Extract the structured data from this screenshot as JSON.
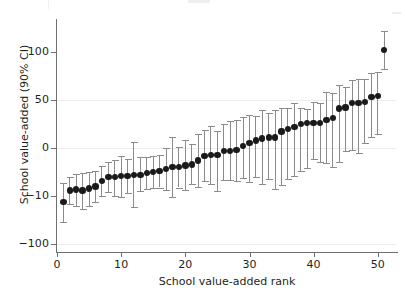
{
  "chart_data": {
    "type": "scatter",
    "subtype": "caterpillar-plot-with-error-bars",
    "title": "",
    "xlabel": "School value-added rank",
    "ylabel": "School value-added (90% CI)",
    "xlim": [
      0,
      53
    ],
    "ylim": [
      -108,
      133
    ],
    "xticks": [
      0,
      10,
      20,
      30,
      40,
      50
    ],
    "xtick_labels": [
      "0",
      "10",
      "20",
      "30",
      "40",
      "50"
    ],
    "yticks": [
      100,
      50,
      0,
      -50,
      -100
    ],
    "ytick_labels": [
      "100",
      "50",
      "0",
      "−10",
      "−100"
    ],
    "grid": "horizontal-only",
    "gridlines_at": [
      50,
      0,
      -100
    ],
    "legend": "none",
    "error_bar_level": "90% CI",
    "marker_color": "#1a1a1a",
    "errorbar_color": "#8b8b8e",
    "gridline_color": "#ededee",
    "axis_color": "#6f6f72",
    "n_points": 52,
    "x": [
      1,
      2,
      3,
      4,
      5,
      6,
      7,
      8,
      9,
      10,
      11,
      12,
      13,
      14,
      15,
      16,
      17,
      18,
      19,
      20,
      21,
      22,
      23,
      24,
      25,
      26,
      27,
      28,
      29,
      30,
      31,
      32,
      33,
      34,
      35,
      36,
      37,
      38,
      39,
      40,
      41,
      42,
      43,
      44,
      45,
      46,
      47,
      48,
      49,
      50,
      51,
      52
    ],
    "y": [
      -56,
      -44,
      -43,
      -44,
      -42,
      -40,
      -34,
      -30,
      -30,
      -29,
      -29,
      -28,
      -28,
      -26,
      -25,
      -24,
      -22,
      -20,
      -20,
      -18,
      -17,
      -13,
      -8,
      -7,
      -7,
      -3,
      -3,
      -2,
      2,
      5,
      8,
      10,
      11,
      11,
      17,
      20,
      22,
      25,
      26,
      26,
      26,
      29,
      31,
      41,
      42,
      47,
      47,
      48,
      53,
      54,
      102
    ],
    "y_lower": [
      -77,
      -58,
      -60,
      -63,
      -60,
      -56,
      -50,
      -46,
      -50,
      -51,
      -47,
      -61,
      -45,
      -43,
      -42,
      -41,
      -44,
      -51,
      -41,
      -44,
      -37,
      -40,
      -34,
      -37,
      -45,
      -33,
      -33,
      -34,
      -31,
      -35,
      -30,
      -37,
      -32,
      -43,
      -38,
      -32,
      -29,
      -24,
      -21,
      -11,
      -14,
      -16,
      -20,
      -14,
      -3,
      -2,
      -5,
      5,
      11,
      15,
      82
    ],
    "y_upper": [
      -36,
      -30,
      -27,
      -26,
      -25,
      -24,
      -19,
      -14,
      -12,
      -8,
      -11,
      6,
      -9,
      -9,
      -8,
      -7,
      0,
      11,
      1,
      8,
      4,
      15,
      19,
      23,
      18,
      25,
      28,
      29,
      32,
      34,
      33,
      39,
      36,
      39,
      42,
      42,
      47,
      42,
      41,
      48,
      47,
      58,
      57,
      65,
      63,
      71,
      72,
      72,
      78,
      79,
      122
    ]
  },
  "axis": {
    "y_title": "School value-added (90% CI)",
    "x_title": "School value-added rank"
  }
}
